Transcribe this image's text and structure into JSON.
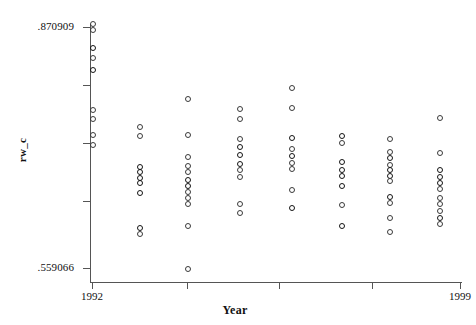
{
  "axes": {
    "y": {
      "title": "rw_c",
      "ticks": [
        {
          "label": ".870909",
          "value": 0.870909,
          "py": 27,
          "labeled": true
        },
        {
          "label": "",
          "value": 0.792,
          "py": 85,
          "labeled": false
        },
        {
          "label": "",
          "value": 0.714,
          "py": 143,
          "labeled": false
        },
        {
          "label": "",
          "value": 0.637,
          "py": 201,
          "labeled": false
        },
        {
          "label": ".559066",
          "value": 0.559066,
          "py": 268,
          "labeled": true
        }
      ],
      "min": 0.559066,
      "max": 0.870909
    },
    "x": {
      "title": "Year",
      "ticks": [
        {
          "label": "1992",
          "value": 1992,
          "px": 92,
          "labeled": true
        },
        {
          "label": "",
          "value": 1994,
          "px": 187,
          "labeled": false
        },
        {
          "label": "",
          "value": 1996,
          "px": 279,
          "labeled": false
        },
        {
          "label": "",
          "value": 1998,
          "px": 372,
          "labeled": false
        },
        {
          "label": "1999",
          "value": 1999,
          "px": 460,
          "labeled": true
        }
      ],
      "min": 1992,
      "max": 1999
    }
  },
  "chart_data": {
    "type": "scatter",
    "title": "",
    "xlabel": "Year",
    "ylabel": "rw_c",
    "xlim": [
      1992,
      1999
    ],
    "ylim": [
      0.559066,
      0.870909
    ],
    "grid": false,
    "legend": null,
    "marker": "open-circle",
    "series": [
      {
        "name": "rw_c",
        "points": [
          {
            "x": 1992,
            "y": 0.8709,
            "px": 93,
            "py": 24
          },
          {
            "x": 1992,
            "y": 0.867,
            "px": 93,
            "py": 30
          },
          {
            "x": 1992,
            "y": 0.843,
            "px": 93,
            "py": 48,
            "dense": true
          },
          {
            "x": 1992,
            "y": 0.829,
            "px": 93,
            "py": 58
          },
          {
            "x": 1992,
            "y": 0.814,
            "px": 93,
            "py": 70,
            "dense": true
          },
          {
            "x": 1992,
            "y": 0.76,
            "px": 93,
            "py": 110
          },
          {
            "x": 1992,
            "y": 0.748,
            "px": 93,
            "py": 119
          },
          {
            "x": 1992,
            "y": 0.726,
            "px": 93,
            "py": 135
          },
          {
            "x": 1992,
            "y": 0.713,
            "px": 93,
            "py": 145
          },
          {
            "x": 1993,
            "y": 0.737,
            "px": 140,
            "py": 127
          },
          {
            "x": 1993,
            "y": 0.725,
            "px": 140,
            "py": 136
          },
          {
            "x": 1993,
            "y": 0.683,
            "px": 140,
            "py": 167,
            "dense": true
          },
          {
            "x": 1993,
            "y": 0.676,
            "px": 140,
            "py": 172,
            "dense": true
          },
          {
            "x": 1993,
            "y": 0.669,
            "px": 140,
            "py": 178,
            "dense": true
          },
          {
            "x": 1993,
            "y": 0.662,
            "px": 140,
            "py": 183,
            "dense": true
          },
          {
            "x": 1993,
            "y": 0.649,
            "px": 140,
            "py": 193,
            "dense": true
          },
          {
            "x": 1993,
            "y": 0.603,
            "px": 140,
            "py": 228,
            "dense": true
          },
          {
            "x": 1993,
            "y": 0.596,
            "px": 140,
            "py": 234
          },
          {
            "x": 1994,
            "y": 0.775,
            "px": 188,
            "py": 99
          },
          {
            "x": 1994,
            "y": 0.726,
            "px": 188,
            "py": 135
          },
          {
            "x": 1994,
            "y": 0.696,
            "px": 188,
            "py": 157
          },
          {
            "x": 1994,
            "y": 0.685,
            "px": 188,
            "py": 166
          },
          {
            "x": 1994,
            "y": 0.677,
            "px": 188,
            "py": 172
          },
          {
            "x": 1994,
            "y": 0.666,
            "px": 188,
            "py": 180,
            "dense": true
          },
          {
            "x": 1994,
            "y": 0.659,
            "px": 188,
            "py": 186,
            "dense": true
          },
          {
            "x": 1994,
            "y": 0.651,
            "px": 188,
            "py": 192
          },
          {
            "x": 1994,
            "y": 0.643,
            "px": 188,
            "py": 198
          },
          {
            "x": 1994,
            "y": 0.635,
            "px": 188,
            "py": 204
          },
          {
            "x": 1994,
            "y": 0.605,
            "px": 188,
            "py": 226
          },
          {
            "x": 1994,
            "y": 0.56,
            "px": 188,
            "py": 269
          },
          {
            "x": 1995,
            "y": 0.761,
            "px": 240,
            "py": 109
          },
          {
            "x": 1995,
            "y": 0.748,
            "px": 240,
            "py": 119
          },
          {
            "x": 1995,
            "y": 0.721,
            "px": 240,
            "py": 139
          },
          {
            "x": 1995,
            "y": 0.71,
            "px": 240,
            "py": 147,
            "dense": true
          },
          {
            "x": 1995,
            "y": 0.699,
            "px": 240,
            "py": 155,
            "dense": true
          },
          {
            "x": 1995,
            "y": 0.687,
            "px": 240,
            "py": 164,
            "dense": true
          },
          {
            "x": 1995,
            "y": 0.679,
            "px": 240,
            "py": 170
          },
          {
            "x": 1995,
            "y": 0.67,
            "px": 240,
            "py": 177
          },
          {
            "x": 1995,
            "y": 0.634,
            "px": 240,
            "py": 204
          },
          {
            "x": 1995,
            "y": 0.623,
            "px": 240,
            "py": 213
          },
          {
            "x": 1996,
            "y": 0.79,
            "px": 292,
            "py": 88
          },
          {
            "x": 1996,
            "y": 0.763,
            "px": 292,
            "py": 108
          },
          {
            "x": 1996,
            "y": 0.722,
            "px": 292,
            "py": 138,
            "dense": true
          },
          {
            "x": 1996,
            "y": 0.707,
            "px": 292,
            "py": 149
          },
          {
            "x": 1996,
            "y": 0.698,
            "px": 292,
            "py": 156,
            "dense": true
          },
          {
            "x": 1996,
            "y": 0.689,
            "px": 292,
            "py": 163
          },
          {
            "x": 1996,
            "y": 0.68,
            "px": 292,
            "py": 169
          },
          {
            "x": 1996,
            "y": 0.652,
            "px": 292,
            "py": 190
          },
          {
            "x": 1996,
            "y": 0.628,
            "px": 292,
            "py": 208,
            "dense": true
          },
          {
            "x": 1997,
            "y": 0.725,
            "px": 342,
            "py": 136,
            "dense": true
          },
          {
            "x": 1997,
            "y": 0.716,
            "px": 342,
            "py": 143
          },
          {
            "x": 1997,
            "y": 0.69,
            "px": 342,
            "py": 162,
            "dense": true
          },
          {
            "x": 1997,
            "y": 0.679,
            "px": 342,
            "py": 170,
            "dense": true
          },
          {
            "x": 1997,
            "y": 0.671,
            "px": 342,
            "py": 176,
            "dense": true
          },
          {
            "x": 1997,
            "y": 0.658,
            "px": 342,
            "py": 186,
            "dense": true
          },
          {
            "x": 1997,
            "y": 0.633,
            "px": 342,
            "py": 205
          },
          {
            "x": 1997,
            "y": 0.605,
            "px": 342,
            "py": 226,
            "dense": true
          },
          {
            "x": 1998,
            "y": 0.721,
            "px": 390,
            "py": 139
          },
          {
            "x": 1998,
            "y": 0.704,
            "px": 390,
            "py": 152
          },
          {
            "x": 1998,
            "y": 0.695,
            "px": 390,
            "py": 158,
            "dense": true
          },
          {
            "x": 1998,
            "y": 0.686,
            "px": 390,
            "py": 165
          },
          {
            "x": 1998,
            "y": 0.679,
            "px": 390,
            "py": 170,
            "dense": true
          },
          {
            "x": 1998,
            "y": 0.672,
            "px": 390,
            "py": 176,
            "dense": true
          },
          {
            "x": 1998,
            "y": 0.664,
            "px": 390,
            "py": 181
          },
          {
            "x": 1998,
            "y": 0.643,
            "px": 390,
            "py": 197,
            "dense": true
          },
          {
            "x": 1998,
            "y": 0.636,
            "px": 390,
            "py": 203
          },
          {
            "x": 1998,
            "y": 0.616,
            "px": 390,
            "py": 218
          },
          {
            "x": 1998,
            "y": 0.598,
            "px": 390,
            "py": 232
          },
          {
            "x": 1999,
            "y": 0.749,
            "px": 440,
            "py": 118
          },
          {
            "x": 1999,
            "y": 0.702,
            "px": 440,
            "py": 153
          },
          {
            "x": 1999,
            "y": 0.679,
            "px": 440,
            "py": 170,
            "dense": true
          },
          {
            "x": 1999,
            "y": 0.67,
            "px": 440,
            "py": 177,
            "dense": true
          },
          {
            "x": 1999,
            "y": 0.662,
            "px": 440,
            "py": 183,
            "dense": true
          },
          {
            "x": 1999,
            "y": 0.653,
            "px": 440,
            "py": 189
          },
          {
            "x": 1999,
            "y": 0.642,
            "px": 440,
            "py": 198
          },
          {
            "x": 1999,
            "y": 0.634,
            "px": 440,
            "py": 204
          },
          {
            "x": 1999,
            "y": 0.625,
            "px": 440,
            "py": 211
          },
          {
            "x": 1999,
            "y": 0.616,
            "px": 440,
            "py": 218,
            "dense": true
          },
          {
            "x": 1999,
            "y": 0.608,
            "px": 440,
            "py": 224
          }
        ]
      }
    ]
  }
}
